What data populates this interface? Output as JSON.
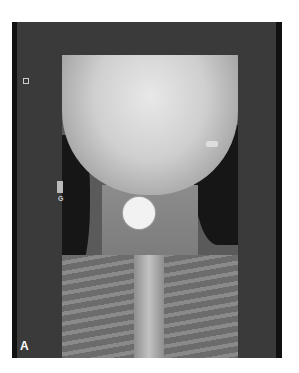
{
  "figure": {
    "panel_label": "A",
    "markers": {
      "side_marker_letter": "G"
    },
    "colors": {
      "frame": "#3a3a3a",
      "foreign_body": "#f2f2f2"
    }
  }
}
